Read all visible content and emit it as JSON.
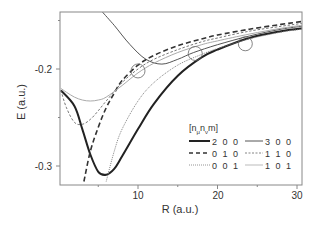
{
  "chart_data": {
    "type": "line",
    "title": "",
    "xlabel": "R (a.u.)",
    "ylabel": "E (a.u.)",
    "xlim": [
      0.2,
      30.6
    ],
    "ylim": [
      -0.316,
      -0.141
    ],
    "x_ticks": [
      10,
      20,
      30
    ],
    "y_ticks": [
      -0.2,
      -0.3
    ],
    "grid": false,
    "legend_title": "[nμ nν m]",
    "legend_position": "lower right inside",
    "series": [
      {
        "name": "200",
        "style": "solid-thick",
        "color": "#222222",
        "x": [
          0.3,
          2,
          3,
          4,
          5,
          6,
          7,
          8,
          10,
          12,
          15,
          18,
          20,
          24,
          28,
          30.6
        ],
        "y": [
          -0.222,
          -0.238,
          -0.262,
          -0.288,
          -0.306,
          -0.309,
          -0.303,
          -0.29,
          -0.262,
          -0.236,
          -0.207,
          -0.188,
          -0.18,
          -0.168,
          -0.161,
          -0.158
        ]
      },
      {
        "name": "300",
        "style": "solid-thin",
        "color": "#555555",
        "x": [
          5.5,
          7,
          9,
          11,
          13,
          15,
          17,
          20,
          24,
          28,
          30.6
        ],
        "y": [
          -0.141,
          -0.155,
          -0.175,
          -0.19,
          -0.195,
          -0.19,
          -0.183,
          -0.175,
          -0.166,
          -0.159,
          -0.156
        ]
      },
      {
        "name": "010",
        "style": "dashed-thick",
        "color": "#333333",
        "x": [
          3.2,
          4,
          5,
          6,
          7,
          8,
          10,
          12,
          15,
          18,
          20,
          24,
          28,
          30.6
        ],
        "y": [
          -0.316,
          -0.285,
          -0.26,
          -0.24,
          -0.225,
          -0.212,
          -0.196,
          -0.186,
          -0.176,
          -0.169,
          -0.165,
          -0.159,
          -0.154,
          -0.151
        ]
      },
      {
        "name": "110",
        "style": "dashed-thin",
        "color": "#666666",
        "x": [
          0.3,
          1,
          2,
          3,
          4,
          5,
          6,
          8,
          10,
          12,
          15,
          18,
          20,
          24,
          28,
          30.6
        ],
        "y": [
          -0.222,
          -0.24,
          -0.255,
          -0.257,
          -0.252,
          -0.243,
          -0.233,
          -0.214,
          -0.2,
          -0.19,
          -0.18,
          -0.172,
          -0.168,
          -0.161,
          -0.156,
          -0.153
        ]
      },
      {
        "name": "001",
        "style": "dotted",
        "color": "#777777",
        "x": [
          6.0,
          7,
          8,
          10,
          12,
          15,
          18,
          20,
          24,
          28,
          30.6
        ],
        "y": [
          -0.316,
          -0.285,
          -0.262,
          -0.233,
          -0.214,
          -0.196,
          -0.185,
          -0.179,
          -0.169,
          -0.162,
          -0.159
        ]
      },
      {
        "name": "101",
        "style": "solid-light",
        "color": "#aaaaaa",
        "x": [
          0.3,
          1,
          2,
          3,
          4,
          5,
          6,
          8,
          10,
          12,
          15,
          18,
          20,
          24,
          28,
          30.6
        ],
        "y": [
          -0.22,
          -0.224,
          -0.229,
          -0.232,
          -0.233,
          -0.232,
          -0.229,
          -0.217,
          -0.204,
          -0.194,
          -0.183,
          -0.175,
          -0.171,
          -0.164,
          -0.158,
          -0.155
        ]
      }
    ],
    "annotations": [
      {
        "type": "circle",
        "x": 10.0,
        "y": -0.202,
        "label": "crossing 1"
      },
      {
        "type": "circle",
        "x": 17.2,
        "y": -0.184,
        "label": "crossing 2"
      },
      {
        "type": "circle",
        "x": 23.5,
        "y": -0.174,
        "label": "crossing 3"
      }
    ]
  },
  "axes": {
    "x_label": "R (a.u.)",
    "y_label": "E (a.u.)",
    "x_tick_labels": [
      "10",
      "20",
      "30"
    ],
    "y_tick_labels": [
      "-0.2",
      "-0.3"
    ]
  },
  "legend": {
    "title": "[n",
    "title_sub1": "μ",
    "title_mid": "n",
    "title_sub2": "ν",
    "title_end": "m]",
    "entries": [
      {
        "label": "2 0 0"
      },
      {
        "label": "3 0 0"
      },
      {
        "label": "0 1 0"
      },
      {
        "label": "1 1 0"
      },
      {
        "label": "0 0 1"
      },
      {
        "label": "1 0 1"
      }
    ]
  }
}
